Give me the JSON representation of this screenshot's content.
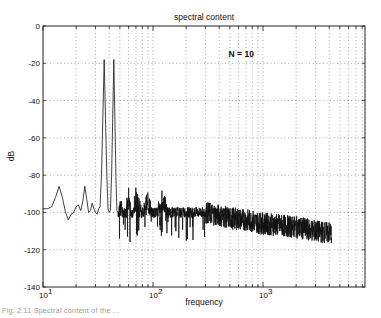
{
  "chart_data": {
    "type": "line",
    "title": "spectral content",
    "xlabel": "frequency",
    "ylabel": "dB",
    "xscale": "log",
    "xlim": [
      10,
      8500
    ],
    "ylim": [
      -140,
      0
    ],
    "grid": true,
    "xticks": [
      10,
      100,
      1000
    ],
    "xtick_labels": [
      "10^1",
      "10^2",
      "10^3"
    ],
    "yticks": [
      0,
      -20,
      -40,
      -60,
      -80,
      -100,
      -120,
      -140
    ],
    "ytick_labels": [
      "0",
      "-20",
      "-40",
      "-60",
      "-80",
      "-100",
      "-120",
      "-140"
    ],
    "annotations": [
      {
        "text": "N = 10",
        "x": 600,
        "y": -20
      }
    ],
    "series": [
      {
        "name": "spectrum",
        "x": [
          10,
          11,
          12,
          13,
          14,
          15,
          16,
          17,
          18,
          19,
          20,
          21,
          22,
          23,
          24,
          25,
          26,
          27,
          28,
          29,
          30,
          31,
          32,
          33,
          34,
          35,
          36,
          37,
          38,
          39,
          40,
          41,
          42,
          43,
          44,
          45,
          46,
          47,
          48,
          50,
          55,
          60,
          65,
          70,
          80,
          90,
          100,
          120,
          150,
          200,
          300,
          500,
          700,
          1000,
          1500,
          2000,
          3000,
          4000,
          4200
        ],
        "values": [
          -98,
          -98,
          -97,
          -92,
          -86,
          -92,
          -100,
          -104,
          -101,
          -100,
          -97,
          -96,
          -99,
          -94,
          -86,
          -93,
          -100,
          -99,
          -95,
          -98,
          -100,
          -101,
          -98,
          -97,
          -80,
          -50,
          -18,
          -50,
          -80,
          -98,
          -100,
          -99,
          -80,
          -50,
          -18,
          -50,
          -80,
          -99,
          -100,
          -92,
          -99,
          -90,
          -100,
          -88,
          -97,
          -90,
          -100,
          -92,
          -98,
          -100,
          -100,
          -103,
          -104,
          -106,
          -107,
          -108,
          -110,
          -111,
          -111
        ]
      }
    ],
    "peaks": [
      {
        "frequency": 36,
        "db": -18
      },
      {
        "frequency": 44,
        "db": -18
      }
    ],
    "noise_floor_db": -100
  },
  "caption": {
    "text": "Fig. 2.11 Spectral content of the ..."
  }
}
